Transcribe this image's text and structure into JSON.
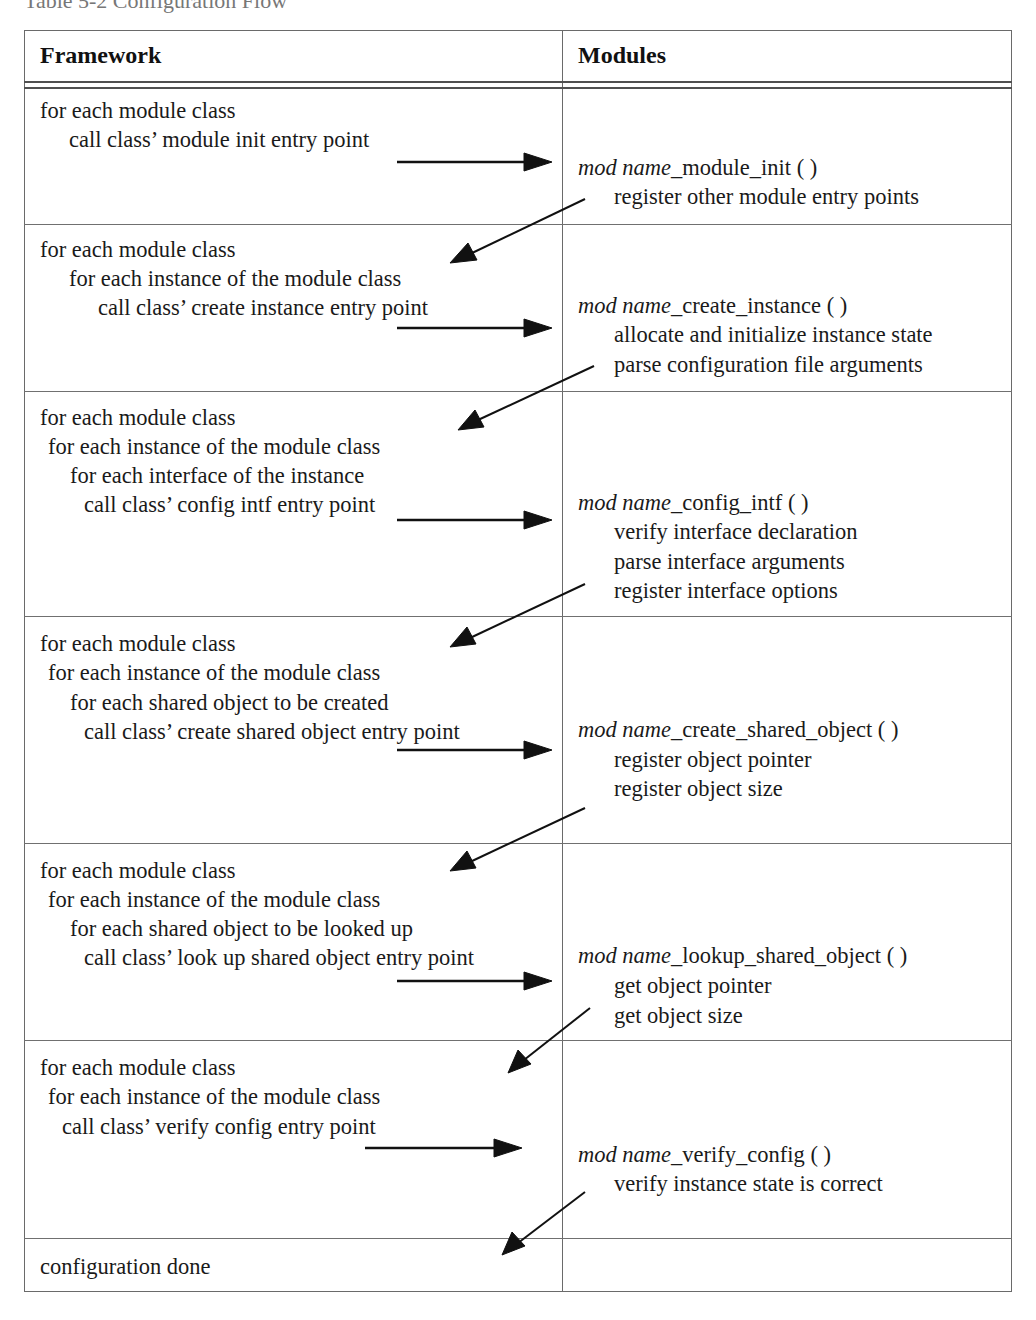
{
  "caption": "Table 5-2  Configuration Flow",
  "table": {
    "headers": {
      "framework": "Framework",
      "modules": "Modules"
    },
    "rows": [
      {
        "framework": [
          "for each module class",
          "call class’ module init entry point"
        ],
        "module_fn": {
          "prefix": "mod name",
          "suffix": "_module_init ( )"
        },
        "module_steps": [
          "register other module entry points"
        ]
      },
      {
        "framework": [
          "for each module class",
          "for each instance of the module class",
          "call class’ create instance entry point"
        ],
        "module_fn": {
          "prefix": "mod name",
          "suffix": "_create_instance ( )"
        },
        "module_steps": [
          "allocate and initialize instance state",
          "parse configuration file arguments"
        ]
      },
      {
        "framework": [
          "for each module class",
          "for each instance of the module class",
          "for each interface of the instance",
          "call class’ config intf entry point"
        ],
        "module_fn": {
          "prefix": "mod name",
          "suffix": "_config_intf ( )"
        },
        "module_steps": [
          "verify interface declaration",
          "parse interface arguments",
          "register interface options"
        ]
      },
      {
        "framework": [
          "for each module class",
          "for each instance of the module class",
          "for each shared object to be created",
          "call class’ create shared object entry point"
        ],
        "module_fn": {
          "prefix": "mod name",
          "suffix": "_create_shared_object ( )"
        },
        "module_steps": [
          "register object pointer",
          "register object size"
        ]
      },
      {
        "framework": [
          "for each module class",
          "for each instance of the module class",
          "for each shared object to be looked up",
          "call class’ look up shared object entry point"
        ],
        "module_fn": {
          "prefix": "mod name",
          "suffix": "_lookup_shared_object ( )"
        },
        "module_steps": [
          "get object pointer",
          "get object size"
        ]
      },
      {
        "framework": [
          "for each module class",
          "for each instance of the module class",
          "call class’ verify config entry point"
        ],
        "module_fn": {
          "prefix": "mod name",
          "suffix": "_verify_config ( )"
        },
        "module_steps": [
          "verify instance state is correct"
        ]
      },
      {
        "framework": [
          "configuration done"
        ],
        "module_fn": null,
        "module_steps": []
      }
    ]
  },
  "colors": {
    "rule": "#6a6a6a",
    "text": "#1a1a1a",
    "arrow": "#111111"
  }
}
